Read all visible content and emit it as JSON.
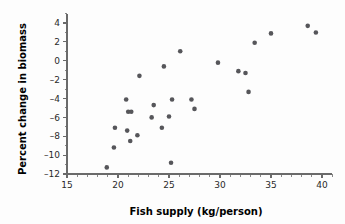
{
  "chart_data": {
    "type": "scatter",
    "title": "",
    "xlabel": "Fish supply (kg/person)",
    "ylabel": "Percent change in biomass",
    "xlim": [
      15,
      41
    ],
    "ylim": [
      -12,
      5
    ],
    "xticks": [
      15,
      20,
      25,
      30,
      35,
      40
    ],
    "xtick_labels": [
      "15",
      "20",
      "25",
      "30",
      "35",
      "40"
    ],
    "yticks": [
      4,
      2,
      0,
      -2,
      -4,
      -6,
      -8,
      -10,
      -12
    ],
    "ytick_labels": [
      "4",
      "2",
      "0",
      "–2",
      "–4",
      "–6",
      "–8",
      "–10",
      "–12"
    ],
    "x_minor_step": 1,
    "y_minor_step": 1,
    "grid": false,
    "legend": false,
    "marker_color": "#56565a",
    "axis_color": "#6a6a6a",
    "background_color": "#fdfdfd",
    "points": [
      {
        "x": 18.9,
        "y": -11.3
      },
      {
        "x": 19.6,
        "y": -9.2
      },
      {
        "x": 19.7,
        "y": -7.1
      },
      {
        "x": 20.8,
        "y": -4.1
      },
      {
        "x": 20.9,
        "y": -7.4
      },
      {
        "x": 21.0,
        "y": -5.4
      },
      {
        "x": 21.3,
        "y": -5.4
      },
      {
        "x": 21.2,
        "y": -8.5
      },
      {
        "x": 21.9,
        "y": -7.9
      },
      {
        "x": 22.1,
        "y": -1.6
      },
      {
        "x": 23.3,
        "y": -6.0
      },
      {
        "x": 23.5,
        "y": -4.7
      },
      {
        "x": 24.3,
        "y": -7.1
      },
      {
        "x": 24.5,
        "y": -0.6
      },
      {
        "x": 25.0,
        "y": -5.9
      },
      {
        "x": 25.2,
        "y": -10.8
      },
      {
        "x": 25.3,
        "y": -4.1
      },
      {
        "x": 26.1,
        "y": 1.0
      },
      {
        "x": 27.2,
        "y": -4.1
      },
      {
        "x": 27.5,
        "y": -5.1
      },
      {
        "x": 29.8,
        "y": -0.2
      },
      {
        "x": 31.8,
        "y": -1.1
      },
      {
        "x": 32.5,
        "y": -1.3
      },
      {
        "x": 32.8,
        "y": -3.3
      },
      {
        "x": 33.4,
        "y": 1.9
      },
      {
        "x": 35.0,
        "y": 2.9
      },
      {
        "x": 38.6,
        "y": 3.7
      },
      {
        "x": 39.4,
        "y": 3.0
      }
    ]
  }
}
